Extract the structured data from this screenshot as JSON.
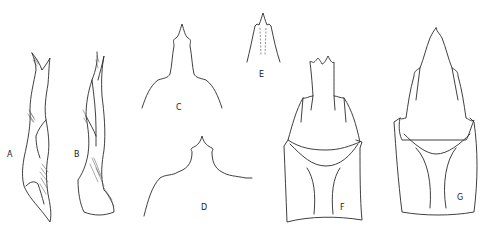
{
  "figure": {
    "panels": [
      {
        "id": "A",
        "label": "A",
        "description": "aedeagus, lateral view"
      },
      {
        "id": "B",
        "label": "B",
        "description": "aedeagus, lateral view (other side)"
      },
      {
        "id": "C",
        "label": "C",
        "description": "apex outline, dorsal"
      },
      {
        "id": "D",
        "label": "D",
        "description": "apex outline, dorsal"
      },
      {
        "id": "E",
        "label": "E",
        "description": "apical tip detail"
      },
      {
        "id": "F",
        "label": "F",
        "description": "genital capsule, ventral view"
      },
      {
        "id": "G",
        "label": "G",
        "description": "genital capsule, ventral view"
      }
    ],
    "stroke_color": "#2a2a2a",
    "background": "#ffffff"
  }
}
